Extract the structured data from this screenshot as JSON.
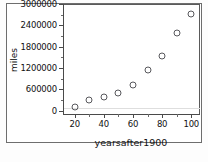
{
  "figure": {
    "background_color": "#ffffff",
    "frame_color": "#6e6e6e",
    "marker_color": "#58585c"
  },
  "chart_data": {
    "type": "scatter",
    "title": "",
    "xlabel": "yearsafter1900",
    "ylabel": "miles",
    "x": [
      20,
      30,
      40,
      50,
      60,
      70,
      80,
      90,
      100
    ],
    "values": [
      120000,
      300000,
      390000,
      500000,
      720000,
      1140000,
      1550000,
      2180000,
      2720000
    ],
    "xlim": [
      12,
      106
    ],
    "ylim": [
      -90000,
      3000000
    ],
    "xticks": [
      20,
      40,
      60,
      80,
      100
    ],
    "xtick_labels": [
      "20",
      "40",
      "60",
      "80",
      "100"
    ],
    "xticks_minor": [
      30,
      50,
      70,
      90
    ],
    "yticks": [
      0,
      600000,
      1200000,
      1800000,
      2400000,
      3000000
    ],
    "ytick_labels": [
      "0",
      "600000",
      "1200000",
      "1800000",
      "2400000",
      "3000000"
    ],
    "yticks_minor": [
      300000,
      900000,
      1500000,
      2100000,
      2700000
    ],
    "grid": false,
    "legend": null,
    "marker_style": "open-circle"
  }
}
